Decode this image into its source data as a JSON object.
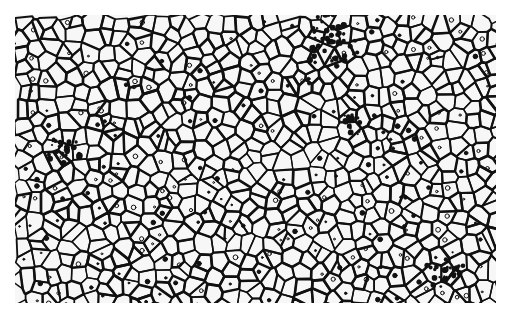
{
  "image": {
    "subject": "metallographic micrograph of polycrystalline grain structure",
    "style": "black grain boundaries on white background",
    "region": {
      "x": 15,
      "y": 15,
      "width": 481,
      "height": 288
    },
    "colors": {
      "boundary": "#111111",
      "grain": "#f7f7f7",
      "page": "#ffffff"
    },
    "features": {
      "grain_count_estimate": 600,
      "dark_clusters": [
        {
          "x": 330,
          "y": 40,
          "r": 30
        },
        {
          "x": 65,
          "y": 150,
          "r": 18
        },
        {
          "x": 350,
          "y": 125,
          "r": 12
        },
        {
          "x": 445,
          "y": 270,
          "r": 20
        }
      ]
    }
  }
}
